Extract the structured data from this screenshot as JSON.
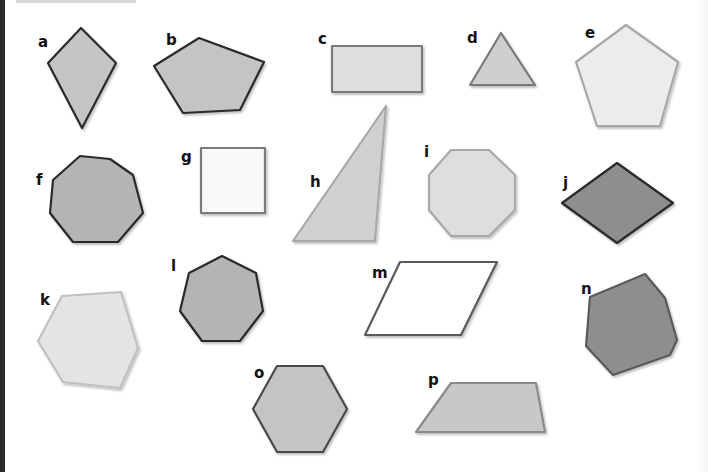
{
  "title": "",
  "colors": {
    "background": "#ffffff",
    "fill_dark": "#8e8e8e",
    "fill_mid": "#c4c4c4",
    "fill_light": "#dedede",
    "fill_lighter": "#ececec",
    "fill_white": "#f9f9f9",
    "stroke_dark": "#2a2a2a",
    "stroke_mid": "#7a7a7a",
    "stroke_light": "#a8a8a8"
  },
  "shapes": [
    {
      "label": "a",
      "kind": "kite",
      "points": "81,28 116,63 82,128 48,63",
      "fill": "#c4c4c4",
      "stroke": "#2a2a2a",
      "label_x": 38,
      "label_y": 47
    },
    {
      "label": "b",
      "kind": "irregular-pentagon",
      "points": "199,38 264,62 240,110 183,113 154,66",
      "fill": "#c4c4c4",
      "stroke": "#2a2a2a",
      "label_x": 166,
      "label_y": 45
    },
    {
      "label": "c",
      "kind": "rectangle",
      "points": "332,46 422,46 422,92 332,92",
      "fill": "#dedede",
      "stroke": "#7a7a7a",
      "label_x": 318,
      "label_y": 44
    },
    {
      "label": "d",
      "kind": "triangle",
      "points": "501,33 535,85 470,85",
      "fill": "#cfcfcf",
      "stroke": "#7a7a7a",
      "label_x": 467,
      "label_y": 43
    },
    {
      "label": "e",
      "kind": "regular-pentagon",
      "points": "626,25 678,62 660,126 597,126 576,62",
      "fill": "#ececec",
      "stroke": "#a8a8a8",
      "label_x": 585,
      "label_y": 38
    },
    {
      "label": "f",
      "kind": "irregular-heptagon",
      "points": "80,156 110,159 133,175 143,213 118,242 73,242 50,213 53,180",
      "fill": "#b4b4b4",
      "stroke": "#2a2a2a",
      "label_x": 36,
      "label_y": 185
    },
    {
      "label": "g",
      "kind": "square",
      "points": "201,148 265,148 265,213 201,213",
      "fill": "#f9f9f9",
      "stroke": "#7a7a7a",
      "label_x": 181,
      "label_y": 162
    },
    {
      "label": "h",
      "kind": "right-triangle",
      "points": "386,106 375,241 293,241",
      "fill": "#d0d0d0",
      "stroke": "#a8a8a8",
      "label_x": 310,
      "label_y": 187
    },
    {
      "label": "i",
      "kind": "octagon",
      "points": "451,150 489,150 515,175 515,210 489,236 451,236 429,210 429,175",
      "fill": "#dedede",
      "stroke": "#a8a8a8",
      "label_x": 424,
      "label_y": 157
    },
    {
      "label": "j",
      "kind": "rhombus",
      "points": "617,163 673,203 617,243 562,203",
      "fill": "#8e8e8e",
      "stroke": "#2a2a2a",
      "label_x": 563,
      "label_y": 188
    },
    {
      "label": "k",
      "kind": "irregular-hexagon",
      "points": "62,296 121,292 138,348 120,388 63,382 38,341",
      "fill": "#e4e4e4",
      "stroke": "#c0c0c0",
      "label_x": 40,
      "label_y": 305
    },
    {
      "label": "l",
      "kind": "regular-heptagon",
      "points": "222,256 256,273 263,311 240,341 202,341 180,311 189,273",
      "fill": "#b4b4b4",
      "stroke": "#2a2a2a",
      "label_x": 171,
      "label_y": 271
    },
    {
      "label": "m",
      "kind": "parallelogram",
      "points": "400,262 497,262 461,335 365,335",
      "fill": "#ffffff",
      "stroke": "#5a5a5a",
      "label_x": 372,
      "label_y": 278
    },
    {
      "label": "n",
      "kind": "irregular-heptagon",
      "points": "645,274 665,298 677,340 670,355 613,375 586,346 590,297",
      "fill": "#8e8e8e",
      "stroke": "#5a5a5a",
      "label_x": 581,
      "label_y": 294
    },
    {
      "label": "o",
      "kind": "regular-hexagon",
      "points": "277,366 323,366 347,409 323,452 277,452 253,409",
      "fill": "#c4c4c4",
      "stroke": "#4a4a4a",
      "label_x": 254,
      "label_y": 378
    },
    {
      "label": "p",
      "kind": "trapezium",
      "points": "451,383 536,383 545,432 416,432",
      "fill": "#c8c8c8",
      "stroke": "#8a8a8a",
      "label_x": 428,
      "label_y": 385
    }
  ]
}
